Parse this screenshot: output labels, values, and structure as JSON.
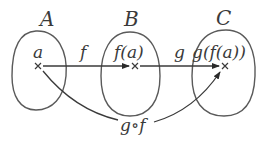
{
  "diagram": {
    "sets": [
      {
        "id": "A",
        "label": "A",
        "element": "a"
      },
      {
        "id": "B",
        "label": "B",
        "element": "f(a)"
      },
      {
        "id": "C",
        "label": "C",
        "element": "g(f(a))"
      }
    ],
    "mappings": [
      {
        "from": "A",
        "to": "B",
        "label": "f"
      },
      {
        "from": "B",
        "to": "C",
        "label": "g"
      },
      {
        "from": "A",
        "to": "C",
        "label": "g∘f"
      }
    ],
    "colors": {
      "stroke": "#3a3a3a",
      "outline": "#5a5a5a",
      "background": "#ffffff"
    }
  }
}
